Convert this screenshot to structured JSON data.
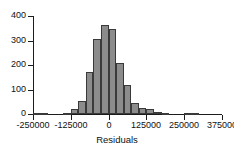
{
  "chart_data": {
    "type": "bar",
    "title": "",
    "subtitle": "",
    "xlabel": "Residuals",
    "ylabel": "",
    "xlim": [
      -250000,
      375000
    ],
    "ylim": [
      0,
      400
    ],
    "grid": false,
    "legend": null,
    "bin_width": 25000,
    "x_ticks": [
      -250000,
      -125000,
      0,
      125000,
      250000,
      375000
    ],
    "x_tick_labels": [
      "-250000",
      "-125000",
      "0",
      "125000",
      "250000",
      "375000"
    ],
    "y_ticks": [
      0,
      100,
      200,
      300,
      400
    ],
    "y_tick_labels": [
      "0",
      "100",
      "200",
      "300",
      "400"
    ],
    "bin_starts": [
      -250000,
      -225000,
      -200000,
      -175000,
      -150000,
      -125000,
      -100000,
      -75000,
      -50000,
      -25000,
      0,
      25000,
      50000,
      75000,
      100000,
      125000,
      150000,
      175000,
      200000,
      225000,
      250000,
      275000,
      300000,
      325000,
      350000
    ],
    "values": [
      4,
      3,
      0,
      0,
      3,
      20,
      52,
      172,
      305,
      365,
      347,
      208,
      120,
      43,
      25,
      22,
      8,
      6,
      0,
      0,
      4,
      4,
      0,
      0,
      0
    ]
  }
}
